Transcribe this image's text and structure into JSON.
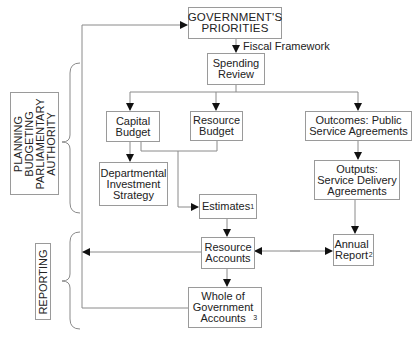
{
  "diagram": {
    "nodes": {
      "government_priorities": {
        "text": "GOVERNMENT'S\nPRIORITIES"
      },
      "spending_review": {
        "text": "Spending\nReview"
      },
      "capital_budget": {
        "text": "Capital\nBudget"
      },
      "resource_budget": {
        "text": "Resource\nBudget"
      },
      "outcomes": {
        "text": "Outcomes: Public\nService Agreements"
      },
      "departmental_investment_strategy": {
        "text": "Departmental\nInvestment\nStrategy"
      },
      "estimates": {
        "text": "Estimates",
        "sup": "1"
      },
      "outputs": {
        "text": "Outputs:\nService Delivery\nAgreements"
      },
      "resource_accounts": {
        "text": "Resource\nAccounts"
      },
      "annual_report": {
        "text": "Annual\nReport",
        "sup": "2"
      },
      "whole_of_government_accounts": {
        "text": "Whole of\nGovernment\nAccounts",
        "sup": "3"
      }
    },
    "edge_labels": {
      "fiscal_framework": "Fiscal Framework"
    },
    "phases": {
      "planning": {
        "text": "PLANNING\nBUDGETING\nPARLIAMENTARY\nAUTHORITY"
      },
      "reporting": {
        "text": "REPORTING"
      }
    },
    "colors": {
      "line": "#8a8a8a",
      "arrow": "#111111",
      "border": "#9a9a9a",
      "text": "#222222"
    }
  }
}
